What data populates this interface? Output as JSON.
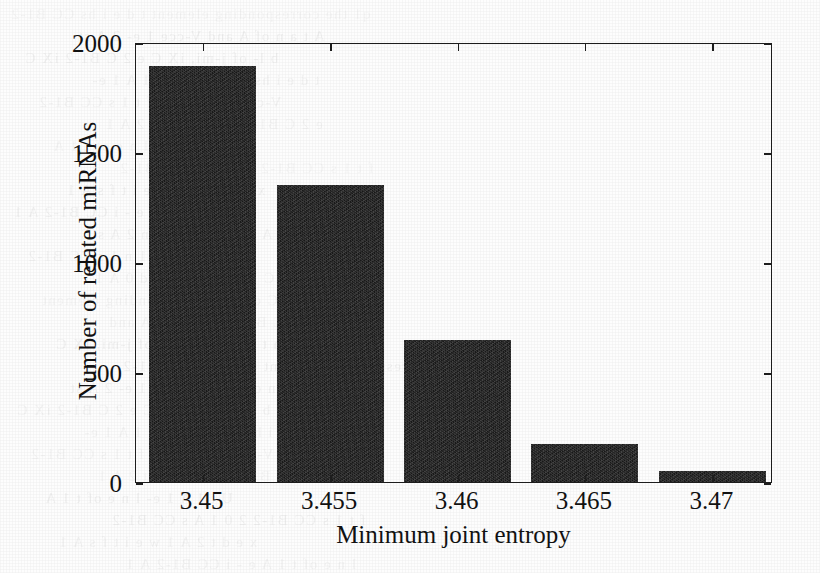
{
  "figure": {
    "background_color": "#fdfdfd",
    "bar_color": "#181818",
    "axis_color": "#1d1d1d"
  },
  "chart_data": {
    "type": "bar",
    "title": "",
    "xlabel": "Minimum joint entropy",
    "ylabel": "Number of related miRNAs",
    "categories": [
      "3.45",
      "3.455",
      "3.46",
      "3.465",
      "3.47"
    ],
    "values": [
      1890,
      1350,
      645,
      173,
      50
    ],
    "ylim": [
      0,
      2000
    ],
    "yticks": [
      0,
      500,
      1000,
      1500,
      2000
    ],
    "ytick_labels": [
      "0",
      "500",
      "1000",
      "1500",
      "2000"
    ],
    "grid": false,
    "legend": null
  },
  "scan_artifacts": {
    "bleed_lines": [
      "q1 the corresponding element",
      "A t a n of A and",
      "b l- of j-mi, iX C",
      "t d e i hs CC B1-2",
      "V-cce 1 e- 2 A st",
      "e 2 C B1-2 iX C",
      "U t 1 A 1 e-",
      "f t 1 s CC B1-2",
      "x e d t 2 A 1",
      "l n e of t 1 A",
      "2 0 1 A s CC B1-2",
      "w e i t f s A 1",
      "e - i CC B1-2 A 1",
      "0 t n 2 A s C",
      "n 1 s CC B1-2",
      "h  t e d  0 A 1"
    ]
  }
}
